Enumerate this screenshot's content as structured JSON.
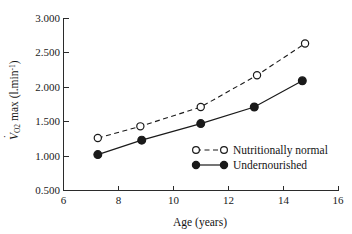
{
  "chart_data": {
    "type": "line",
    "title": "",
    "xlabel": "Age (years)",
    "ylabel": "VO2 max (l.min-1)",
    "xlim": [
      6,
      16
    ],
    "ylim": [
      0.5,
      3.0
    ],
    "xticks": [
      "6",
      "8",
      "10",
      "12",
      "14",
      "16"
    ],
    "xtick_values": [
      6,
      8,
      10,
      12,
      14,
      16
    ],
    "yticks": [
      "0.500",
      "1.000",
      "1.500",
      "2.000",
      "2.500",
      "3.000"
    ],
    "ytick_values": [
      0.5,
      1.0,
      1.5,
      2.0,
      2.5,
      3.0
    ],
    "grid": false,
    "legend_position": "center-right",
    "series": [
      {
        "name": "Nutritionally normal",
        "marker": "open-circle",
        "linestyle": "dashed",
        "color": "#1a1a1a",
        "x": [
          7.25,
          8.8,
          11.0,
          13.05,
          14.8
        ],
        "values": [
          1.26,
          1.43,
          1.71,
          2.17,
          2.63
        ]
      },
      {
        "name": "Undernourished",
        "marker": "filled-circle",
        "linestyle": "solid",
        "color": "#1a1a1a",
        "x": [
          7.25,
          8.85,
          11.0,
          12.95,
          14.7
        ],
        "values": [
          1.02,
          1.23,
          1.47,
          1.71,
          2.09
        ]
      }
    ]
  },
  "axes": {
    "x_title": "Age (years)",
    "y_title_main": "max (l.min",
    "y_title_v": "V",
    "y_title_sub": "O",
    "y_title_sub2": "2",
    "y_title_sup": "-1",
    "y_title_close": ")"
  },
  "legend": {
    "items": [
      {
        "label": "Nutritionally normal",
        "marker": "open-circle",
        "linestyle": "dashed"
      },
      {
        "label": "Undernourished",
        "marker": "filled-circle",
        "linestyle": "solid"
      }
    ]
  }
}
